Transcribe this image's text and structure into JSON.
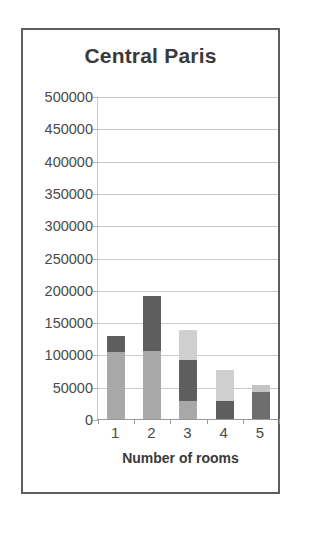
{
  "figure": {
    "border_color": "#5d5d5d",
    "background": "#ffffff"
  },
  "chart_data": {
    "type": "bar",
    "subtype": "stacked-column",
    "title": "Central Paris",
    "subtitle": "",
    "xlabel": "Number of rooms",
    "ylabel": "",
    "categories": [
      "1",
      "2",
      "3",
      "4",
      "5"
    ],
    "ylim": [
      0,
      500000
    ],
    "ytick_labels": [
      "500000",
      "450000",
      "400000",
      "350000",
      "300000",
      "250000",
      "200000",
      "150000",
      "100000",
      "50000",
      "0"
    ],
    "ytick_values": [
      500000,
      450000,
      400000,
      350000,
      300000,
      250000,
      200000,
      150000,
      100000,
      50000,
      0
    ],
    "ytick_step": 50000,
    "grid": true,
    "grid_axis": "y",
    "grid_color": "#c9c9c9",
    "legend": false,
    "legend_position": "none",
    "series": [
      {
        "name": "segment-bottom",
        "color": "#a8a8a8",
        "values": [
          105000,
          107000,
          30000,
          29000,
          43000
        ]
      },
      {
        "name": "segment-middle",
        "color": "#5e5e5e",
        "values": [
          25000,
          85000,
          63000,
          49000,
          11000
        ]
      },
      {
        "name": "segment-top",
        "color": "#cfcfcf",
        "values": [
          0,
          0,
          46000,
          0,
          0
        ]
      }
    ],
    "stack_order_bottom_to_top": [
      "segment-bottom",
      "segment-middle",
      "segment-top"
    ],
    "bar_segments": [
      {
        "category": "1",
        "total": 130000,
        "segments": [
          {
            "from": 0,
            "to": 105000,
            "value": 105000,
            "color": "#a8a8a8"
          },
          {
            "from": 105000,
            "to": 130000,
            "value": 25000,
            "color": "#5e5e5e"
          }
        ]
      },
      {
        "category": "2",
        "total": 192000,
        "segments": [
          {
            "from": 0,
            "to": 107000,
            "value": 107000,
            "color": "#a8a8a8"
          },
          {
            "from": 107000,
            "to": 192000,
            "value": 85000,
            "color": "#5e5e5e"
          }
        ]
      },
      {
        "category": "3",
        "total": 139000,
        "segments": [
          {
            "from": 0,
            "to": 30000,
            "value": 30000,
            "color": "#a8a8a8"
          },
          {
            "from": 30000,
            "to": 93000,
            "value": 63000,
            "color": "#5e5e5e"
          },
          {
            "from": 93000,
            "to": 139000,
            "value": 46000,
            "color": "#cfcfcf"
          }
        ]
      },
      {
        "category": "4",
        "total": 78000,
        "segments": [
          {
            "from": 0,
            "to": 29000,
            "value": 29000,
            "color": "#5e5e5e"
          },
          {
            "from": 29000,
            "to": 78000,
            "value": 49000,
            "color": "#cfcfcf"
          }
        ]
      },
      {
        "category": "5",
        "total": 54000,
        "segments": [
          {
            "from": 0,
            "to": 43000,
            "value": 43000,
            "color": "#6e6e6e"
          },
          {
            "from": 43000,
            "to": 54000,
            "value": 11000,
            "color": "#c4c4c4"
          }
        ]
      }
    ],
    "totals": [
      130000,
      192000,
      139000,
      78000,
      54000
    ]
  }
}
